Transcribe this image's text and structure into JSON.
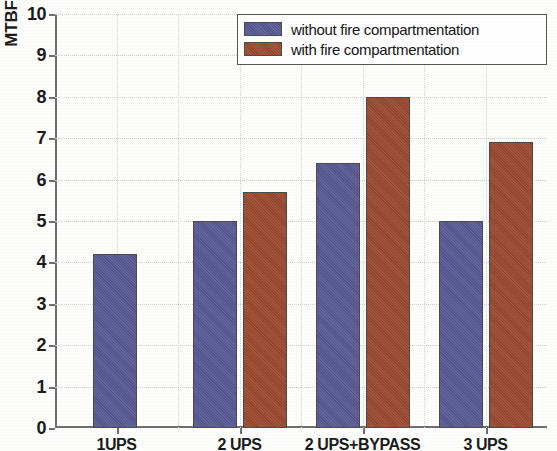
{
  "chart_data": {
    "type": "bar",
    "title": "",
    "xlabel": "",
    "ylabel": "MTBF (years)",
    "ylim": [
      0,
      10
    ],
    "yticks": [
      0,
      1,
      2,
      3,
      4,
      5,
      6,
      7,
      8,
      9,
      10
    ],
    "ytick_labels": [
      "0",
      "1",
      "2",
      "3",
      "4",
      "5",
      "6",
      "7",
      "8",
      "9",
      "10"
    ],
    "categories": [
      "1UPS",
      "2 UPS",
      "2 UPS+BYPASS",
      "3 UPS"
    ],
    "grid": "dotted both axes",
    "legend_position": "top right",
    "series": [
      {
        "name": "without fire compartmentation",
        "color": "#5a5a96",
        "values": [
          4.2,
          5.0,
          6.4,
          5.0
        ]
      },
      {
        "name": "with fire compartmentation",
        "color": "#9c4a30",
        "values": [
          null,
          5.7,
          8.0,
          6.9
        ]
      }
    ]
  },
  "legend": {
    "items": [
      {
        "label": "without fire compartmentation",
        "color": "#5a5a96"
      },
      {
        "label": "with fire compartmentation",
        "color": "#9c4a30"
      }
    ]
  },
  "axes": {
    "y_title": "MTBF (years)"
  }
}
